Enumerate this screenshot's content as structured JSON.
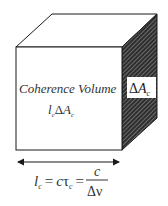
{
  "diagram": {
    "title": "Coherence Volume",
    "volume_expr": {
      "l": "l",
      "l_sub": "c",
      "delta": "Δ",
      "A": "A",
      "A_sub": "c"
    },
    "side_label": {
      "delta": "Δ",
      "A": "A",
      "A_sub": "c"
    },
    "formula": {
      "l": "l",
      "l_sub": "c",
      "eq1": "=",
      "c": "c",
      "tau": "τ",
      "tau_sub": "c",
      "eq2": "=",
      "numerator": "c",
      "denominator": "Δν"
    },
    "colors": {
      "stroke": "#1a1a1a",
      "front_face": "#ffffff",
      "side_face": "#3a3a3a",
      "hatch": "#bfbfbf",
      "background": "#ffffff"
    }
  }
}
